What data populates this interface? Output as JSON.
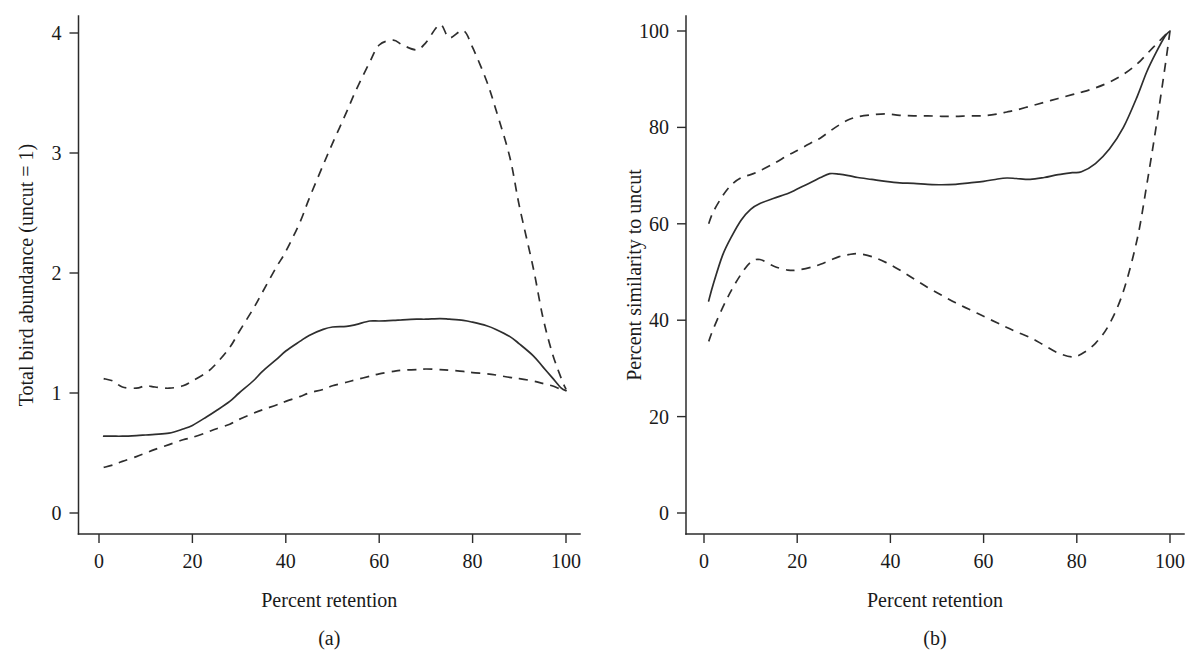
{
  "figure": {
    "background_color": "#ffffff",
    "line_color": "#2e2e2e"
  },
  "panels": [
    {
      "caption": "(a)",
      "xlabel": "Percent retention",
      "ylabel": "Total bird abundance (uncut = 1)",
      "xticks": [
        "0",
        "20",
        "40",
        "60",
        "80",
        "100"
      ],
      "yticks": [
        "0",
        "1",
        "2",
        "3",
        "4"
      ]
    },
    {
      "caption": "(b)",
      "xlabel": "Percent retention",
      "ylabel": "Percent similarity to uncut",
      "xticks": [
        "0",
        "20",
        "40",
        "60",
        "80",
        "100"
      ],
      "yticks": [
        "0",
        "20",
        "40",
        "60",
        "80",
        "100"
      ]
    }
  ],
  "chart_data": [
    {
      "type": "line",
      "title": "(a)",
      "xlabel": "Percent retention",
      "ylabel": "Total bird abundance (uncut = 1)",
      "xlim": [
        0,
        100
      ],
      "ylim": [
        0,
        4.2
      ],
      "xticks": [
        0,
        20,
        40,
        60,
        80,
        100
      ],
      "yticks": [
        0,
        1,
        2,
        3,
        4
      ],
      "grid": false,
      "legend": "none",
      "x": [
        1,
        3,
        5,
        8,
        10,
        12,
        15,
        18,
        20,
        23,
        25,
        28,
        30,
        33,
        35,
        38,
        40,
        43,
        45,
        48,
        50,
        53,
        55,
        58,
        60,
        63,
        65,
        68,
        70,
        73,
        75,
        78,
        80,
        83,
        85,
        88,
        90,
        93,
        95,
        97,
        99,
        100
      ],
      "series": [
        {
          "name": "mean",
          "style": "solid",
          "values": [
            0.64,
            0.64,
            0.64,
            0.645,
            0.65,
            0.655,
            0.665,
            0.7,
            0.73,
            0.8,
            0.85,
            0.93,
            1.0,
            1.1,
            1.18,
            1.28,
            1.35,
            1.43,
            1.48,
            1.53,
            1.55,
            1.555,
            1.57,
            1.6,
            1.6,
            1.605,
            1.61,
            1.615,
            1.615,
            1.62,
            1.615,
            1.605,
            1.59,
            1.56,
            1.53,
            1.47,
            1.41,
            1.31,
            1.22,
            1.13,
            1.04,
            1.02
          ]
        },
        {
          "name": "upper confidence limit",
          "style": "dashed",
          "values": [
            1.12,
            1.1,
            1.05,
            1.04,
            1.06,
            1.05,
            1.04,
            1.06,
            1.1,
            1.17,
            1.24,
            1.38,
            1.51,
            1.7,
            1.84,
            2.05,
            2.18,
            2.42,
            2.62,
            2.9,
            3.08,
            3.34,
            3.52,
            3.76,
            3.9,
            3.94,
            3.9,
            3.86,
            3.92,
            4.07,
            3.96,
            4.02,
            3.88,
            3.6,
            3.36,
            2.96,
            2.56,
            2.04,
            1.64,
            1.34,
            1.12,
            1.03
          ]
        },
        {
          "name": "lower confidence limit",
          "style": "dashed",
          "values": [
            0.38,
            0.4,
            0.43,
            0.47,
            0.5,
            0.53,
            0.57,
            0.61,
            0.63,
            0.67,
            0.7,
            0.74,
            0.78,
            0.83,
            0.86,
            0.9,
            0.93,
            0.97,
            1.0,
            1.03,
            1.06,
            1.09,
            1.11,
            1.14,
            1.16,
            1.18,
            1.19,
            1.195,
            1.2,
            1.195,
            1.19,
            1.18,
            1.17,
            1.16,
            1.15,
            1.13,
            1.12,
            1.1,
            1.08,
            1.06,
            1.03,
            1.02
          ]
        }
      ]
    },
    {
      "type": "line",
      "title": "(b)",
      "xlabel": "Percent retention",
      "ylabel": "Percent similarity to uncut",
      "xlim": [
        0,
        100
      ],
      "ylim": [
        0,
        104
      ],
      "xticks": [
        0,
        20,
        40,
        60,
        80,
        100
      ],
      "yticks": [
        0,
        20,
        40,
        60,
        80,
        100
      ],
      "grid": false,
      "legend": "none",
      "x": [
        1,
        2,
        4,
        6,
        8,
        10,
        12,
        15,
        18,
        20,
        23,
        25,
        27,
        29,
        31,
        33,
        36,
        39,
        42,
        45,
        48,
        51,
        54,
        57,
        60,
        63,
        65,
        67,
        70,
        73,
        76,
        79,
        81,
        84,
        87,
        90,
        93,
        95,
        97,
        99,
        100
      ],
      "series": [
        {
          "name": "mean",
          "style": "solid",
          "values": [
            44.0,
            47.5,
            53.5,
            57.5,
            60.8,
            63.0,
            64.2,
            65.3,
            66.3,
            67.2,
            68.6,
            69.6,
            70.4,
            70.3,
            70.0,
            69.6,
            69.2,
            68.8,
            68.5,
            68.4,
            68.2,
            68.1,
            68.2,
            68.5,
            68.8,
            69.3,
            69.5,
            69.4,
            69.2,
            69.6,
            70.2,
            70.6,
            70.8,
            72.5,
            75.5,
            80.0,
            86.5,
            91.5,
            95.5,
            99.0,
            100.0
          ]
        },
        {
          "name": "upper confidence limit",
          "style": "dashed",
          "values": [
            60.0,
            62.5,
            65.8,
            68.2,
            69.6,
            70.2,
            71.0,
            72.5,
            74.2,
            75.2,
            76.8,
            77.8,
            79.2,
            80.5,
            81.6,
            82.2,
            82.6,
            82.8,
            82.5,
            82.4,
            82.4,
            82.3,
            82.3,
            82.4,
            82.4,
            82.8,
            83.2,
            83.6,
            84.4,
            85.2,
            86.0,
            86.8,
            87.3,
            88.2,
            89.4,
            91.0,
            93.2,
            95.2,
            97.2,
            99.2,
            100.0
          ]
        },
        {
          "name": "lower confidence limit",
          "style": "dashed",
          "values": [
            35.6,
            38.2,
            42.6,
            46.4,
            49.6,
            52.0,
            52.6,
            51.2,
            50.4,
            50.4,
            51.0,
            51.6,
            52.4,
            53.2,
            53.6,
            53.8,
            53.2,
            52.0,
            50.4,
            48.6,
            46.8,
            45.2,
            43.6,
            42.2,
            40.8,
            39.4,
            38.5,
            37.6,
            36.4,
            34.8,
            33.2,
            32.4,
            33.0,
            35.2,
            39.2,
            46.0,
            57.0,
            68.0,
            80.0,
            93.0,
            100.0
          ]
        }
      ]
    }
  ]
}
